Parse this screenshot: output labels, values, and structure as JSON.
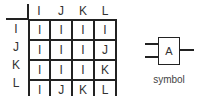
{
  "table": {
    "column_headers": [
      "I",
      "J",
      "K",
      "L"
    ],
    "row_headers": [
      "I",
      "J",
      "K",
      "L"
    ],
    "rows": [
      [
        "I",
        "I",
        "I",
        "I"
      ],
      [
        "I",
        "I",
        "I",
        "J"
      ],
      [
        "I",
        "I",
        "I",
        "K"
      ],
      [
        "I",
        "J",
        "K",
        "L"
      ]
    ]
  },
  "symbol": {
    "gate_label": "A",
    "caption": "symbol",
    "inputs": 2,
    "outputs": 1
  }
}
